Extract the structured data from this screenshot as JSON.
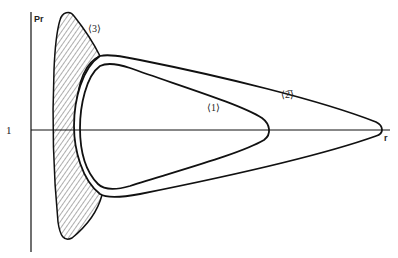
{
  "diagram": {
    "axes": {
      "y_label": "Pr",
      "x_label": "r",
      "y_tick_label": "1"
    },
    "regions": [
      {
        "id": "1",
        "label": "⟨1⟩"
      },
      {
        "id": "2",
        "label": "⟨2̅⟩"
      },
      {
        "id": "3",
        "label": "⟨3⟩"
      }
    ],
    "colors": {
      "line": "#111111",
      "background": "#ffffff"
    }
  }
}
